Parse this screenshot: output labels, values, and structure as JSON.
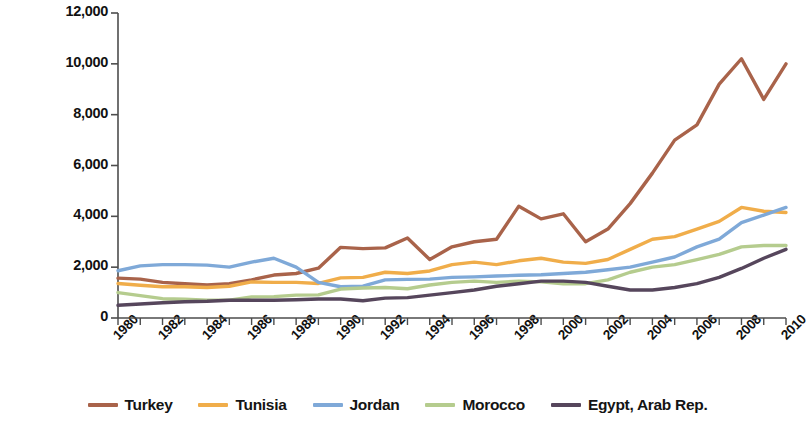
{
  "chart_data": {
    "type": "line",
    "title": "",
    "xlabel": "",
    "ylabel": "GDP/capita (current  U.S. dollars)",
    "ylim": [
      0,
      12000
    ],
    "ytick_values": [
      0,
      2000,
      4000,
      6000,
      8000,
      10000,
      12000
    ],
    "ytick_labels": [
      "0",
      "2,000",
      "4,000",
      "6,000",
      "8,000",
      "10,000",
      "12,000"
    ],
    "xlim": [
      1980,
      2010
    ],
    "x": [
      1980,
      1981,
      1982,
      1983,
      1984,
      1985,
      1986,
      1987,
      1988,
      1989,
      1990,
      1991,
      1992,
      1993,
      1994,
      1995,
      1996,
      1997,
      1998,
      1999,
      2000,
      2001,
      2002,
      2003,
      2004,
      2005,
      2006,
      2007,
      2008,
      2009,
      2010
    ],
    "xtick_labels": [
      "1980",
      "1982",
      "1984",
      "1986",
      "1988",
      "1990",
      "1992",
      "1994",
      "1996",
      "1998",
      "2000",
      "2002",
      "2004",
      "2006",
      "2008",
      "2010"
    ],
    "xtick_label_step": 2,
    "grid": false,
    "legend_position": "bottom",
    "series": [
      {
        "name": "Turkey",
        "color": "#a9634a",
        "values": [
          1570,
          1530,
          1400,
          1350,
          1300,
          1350,
          1500,
          1690,
          1750,
          1960,
          2780,
          2730,
          2760,
          3150,
          2300,
          2800,
          3000,
          3100,
          4400,
          3900,
          4100,
          3000,
          3500,
          4500,
          5700,
          7000,
          7600,
          9200,
          10200,
          8600,
          10000
        ]
      },
      {
        "name": "Tunisia",
        "color": "#f0ad4a",
        "values": [
          1360,
          1290,
          1230,
          1230,
          1200,
          1250,
          1420,
          1400,
          1400,
          1360,
          1580,
          1600,
          1800,
          1750,
          1850,
          2100,
          2200,
          2100,
          2250,
          2350,
          2200,
          2150,
          2300,
          2700,
          3100,
          3200,
          3500,
          3800,
          4350,
          4200,
          4150
        ]
      },
      {
        "name": "Jordan",
        "color": "#7fa9d8",
        "values": [
          1860,
          2050,
          2100,
          2100,
          2080,
          2000,
          2200,
          2350,
          2000,
          1400,
          1230,
          1250,
          1500,
          1520,
          1530,
          1600,
          1620,
          1650,
          1680,
          1700,
          1750,
          1800,
          1900,
          2000,
          2200,
          2400,
          2800,
          3100,
          3750,
          4050,
          4350
        ]
      },
      {
        "name": "Morocco",
        "color": "#b5cc8e",
        "values": [
          1000,
          880,
          760,
          740,
          700,
          700,
          830,
          840,
          900,
          910,
          1140,
          1180,
          1200,
          1150,
          1300,
          1400,
          1450,
          1400,
          1450,
          1420,
          1350,
          1350,
          1500,
          1800,
          2000,
          2100,
          2300,
          2500,
          2800,
          2850,
          2850
        ]
      },
      {
        "name": "Egypt, Arab Rep.",
        "color": "#56465c",
        "values": [
          500,
          550,
          600,
          640,
          660,
          700,
          700,
          700,
          720,
          750,
          750,
          680,
          780,
          800,
          900,
          1000,
          1100,
          1250,
          1350,
          1450,
          1450,
          1400,
          1250,
          1100,
          1100,
          1200,
          1350,
          1600,
          1950,
          2350,
          2700
        ]
      }
    ]
  },
  "legend": {
    "items": [
      {
        "label": "Turkey"
      },
      {
        "label": "Tunisia"
      },
      {
        "label": "Jordan"
      },
      {
        "label": "Morocco"
      },
      {
        "label": "Egypt, Arab Rep."
      }
    ]
  }
}
